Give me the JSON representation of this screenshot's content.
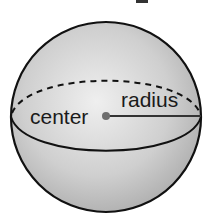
{
  "diagram": {
    "labels": {
      "center": "center",
      "radius": "radius"
    },
    "colors": {
      "outline": "#111111",
      "fill_light": "#eeeeee",
      "fill_dark": "#a9a9a9",
      "center_dot": "#6e6e6e",
      "text": "#1a1a1a"
    }
  }
}
